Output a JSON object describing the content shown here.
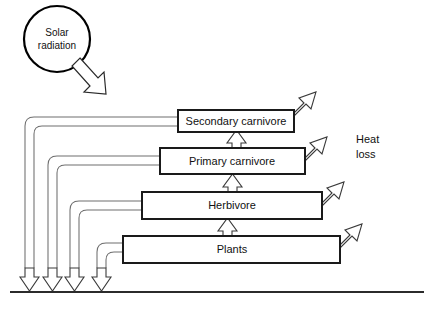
{
  "diagram": {
    "background_color": "#ffffff",
    "ground_line_color": "#2b2b2b",
    "box_border_color": "#1a1a1a",
    "tube_color": "#6e6e6e",
    "source": {
      "label_line1": "Solar",
      "label_line2": "radiation",
      "shape": "circle"
    },
    "trophic_levels": [
      {
        "id": "secondary-carnivore",
        "label": "Secondary carnivore"
      },
      {
        "id": "primary-carnivore",
        "label": "Primary carnivore"
      },
      {
        "id": "herbivore",
        "label": "Herbivore"
      },
      {
        "id": "plants",
        "label": "Plants"
      }
    ],
    "annotations": {
      "heat_loss_line1": "Heat",
      "heat_loss_line2": "loss"
    },
    "icons": {
      "solar_arrow": "solar-input-arrow-icon",
      "heat_arrow": "heat-loss-arrow-icon",
      "transfer_arrow": "energy-transfer-arrow-icon",
      "decomposer_arrow": "decomposer-return-arrow-icon"
    }
  }
}
